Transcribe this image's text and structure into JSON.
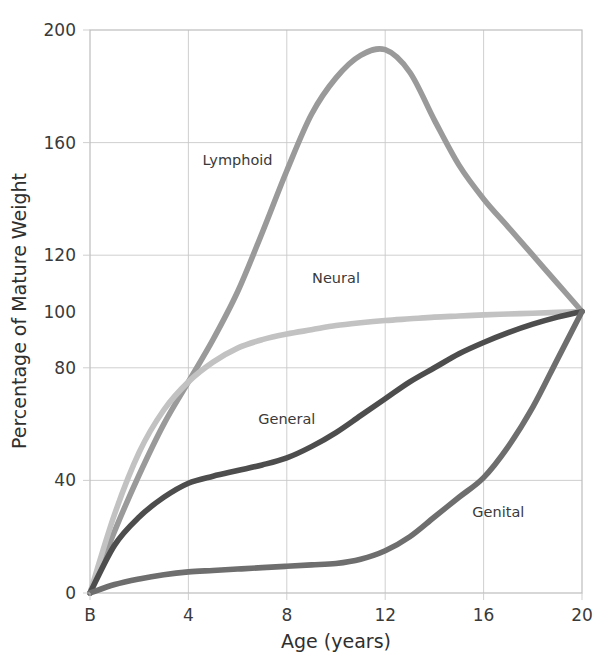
{
  "chart_data": {
    "type": "line",
    "title": "",
    "xlabel": "Age (years)",
    "ylabel": "Percentage of Mature Weight",
    "xlim": [
      0,
      20
    ],
    "ylim": [
      0,
      200
    ],
    "grid": true,
    "legend_position": "inline-labels",
    "x_tick_labels": [
      "B",
      "4",
      "8",
      "12",
      "16",
      "20"
    ],
    "x_tick_values": [
      0,
      4,
      8,
      12,
      16,
      20
    ],
    "y_tick_labels": [
      "0",
      "40",
      "80",
      "100",
      "120",
      "160",
      "200"
    ],
    "y_tick_values": [
      0,
      40,
      80,
      100,
      120,
      160,
      200
    ],
    "y_gridline_values": [
      40,
      80,
      120,
      160
    ],
    "x": [
      0,
      1,
      2,
      3,
      4,
      5,
      6,
      7,
      8,
      9,
      10,
      11,
      12,
      13,
      14,
      15,
      16,
      17,
      18,
      19,
      20
    ],
    "series": [
      {
        "name": "Lymphoid",
        "color": "#9a9a9a",
        "label_x": 6.0,
        "label_y": 152,
        "values": [
          0,
          22,
          42,
          60,
          75,
          90,
          107,
          128,
          150,
          170,
          183,
          191,
          193,
          185,
          168,
          152,
          140,
          130,
          120,
          110,
          100
        ]
      },
      {
        "name": "Neural",
        "color": "#c2c2c2",
        "label_x": 10.0,
        "label_y": 110,
        "values": [
          0,
          28,
          50,
          65,
          75,
          82,
          87,
          90,
          92,
          93.5,
          95,
          96,
          96.8,
          97.4,
          98,
          98.4,
          98.8,
          99.1,
          99.4,
          99.7,
          100
        ]
      },
      {
        "name": "General",
        "color": "#4d4d4d",
        "label_x": 8.0,
        "label_y": 60,
        "values": [
          0,
          17,
          27,
          34,
          39,
          41.5,
          43.5,
          45.5,
          48,
          52,
          57,
          63,
          69,
          75,
          80,
          85,
          89,
          92.5,
          95.5,
          98,
          100
        ]
      },
      {
        "name": "Genital",
        "color": "#6e6e6e",
        "label_x": 16.6,
        "label_y": 27,
        "values": [
          0,
          3,
          5,
          6.5,
          7.5,
          8,
          8.5,
          9,
          9.5,
          10,
          10.5,
          12,
          15,
          20,
          27,
          34,
          41,
          52,
          66,
          83,
          100
        ]
      }
    ]
  },
  "axes": {
    "x_label": "Age (years)",
    "y_label": "Percentage of Mature Weight"
  },
  "top_fragment": ""
}
